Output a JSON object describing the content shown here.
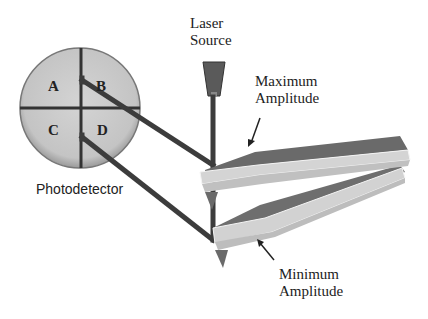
{
  "diagram": {
    "labels": {
      "laser_source_line1": "Laser",
      "laser_source_line2": "Source",
      "max_amp_line1": "Maximum",
      "max_amp_line2": "Amplitude",
      "min_amp_line1": "Minimum",
      "min_amp_line2": "Amplitude",
      "photodetector": "Photodetector"
    },
    "quadrants": [
      "A",
      "B",
      "C",
      "D"
    ],
    "colors": {
      "detector_fill": "#c8c8c8",
      "beam": "#3a3a3a",
      "cantilever_top": "#6a6a6a",
      "cantilever_side": "#d0d0d0",
      "laser": "#555555"
    }
  }
}
